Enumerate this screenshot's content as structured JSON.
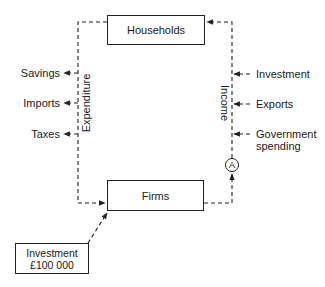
{
  "diagram": {
    "nodes": {
      "households": "Households",
      "firms": "Firms",
      "investment_box": {
        "line1": "Investment",
        "line2": "£100 000"
      },
      "marker": "A"
    },
    "flows": {
      "left_axis_label": "Expenditure",
      "right_axis_label": "Income"
    },
    "withdrawals": [
      {
        "label": "Savings"
      },
      {
        "label": "Imports"
      },
      {
        "label": "Taxes"
      }
    ],
    "injections": [
      {
        "label": "Investment"
      },
      {
        "label": "Exports"
      },
      {
        "label": "Government",
        "label2": "spending"
      }
    ],
    "colors": {
      "line": "#222222",
      "background": "#ffffff"
    }
  }
}
